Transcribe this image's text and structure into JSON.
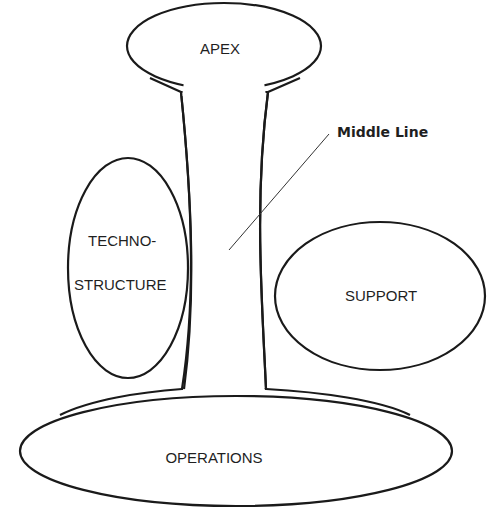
{
  "diagram": {
    "parts": {
      "apex": {
        "label": "APEX"
      },
      "middle_line": {
        "label": "Middle Line"
      },
      "technostructure": {
        "label_line1": "TECHNO-",
        "label_line2": "STRUCTURE"
      },
      "support": {
        "label": "SUPPORT"
      },
      "operations": {
        "label": "OPERATIONS"
      }
    },
    "colors": {
      "stroke": "#1a1a1a",
      "background": "#ffffff",
      "text": "#1f1f1f"
    }
  }
}
